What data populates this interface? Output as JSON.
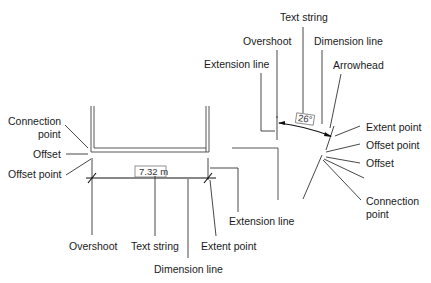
{
  "linear_dimension": {
    "value_text": "7.32 m",
    "labels": {
      "connection_point": [
        "Connection",
        "point"
      ],
      "offset": "Offset",
      "offset_point": "Offset point",
      "overshoot": "Overshoot",
      "text_string": "Text string",
      "dimension_line": "Dimension line",
      "extent_point": "Extent point",
      "extension_line": "Extension line"
    }
  },
  "angular_dimension": {
    "value_text": "26°",
    "labels": {
      "text_string": "Text string",
      "overshoot": "Overshoot",
      "dimension_line": "Dimension line",
      "extension_line": "Extension line",
      "arrowhead": "Arrowhead",
      "extent_point": "Extent point",
      "offset_point": "Offset point",
      "offset": "Offset",
      "connection_point": [
        "Connection",
        "point"
      ]
    }
  }
}
